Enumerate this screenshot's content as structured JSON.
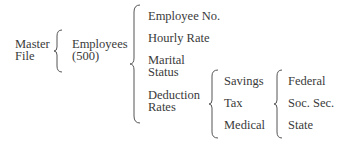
{
  "diagram": {
    "type": "bracket-hierarchy",
    "root": {
      "line1": "Master",
      "line2": "File"
    },
    "level1": {
      "line1": "Employees",
      "line2": "(500)"
    },
    "level2": [
      {
        "id": "employee-no",
        "lines": [
          "Employee No."
        ]
      },
      {
        "id": "hourly-rate",
        "lines": [
          "Hourly Rate"
        ]
      },
      {
        "id": "marital-status",
        "lines": [
          "Marital",
          "Status"
        ]
      },
      {
        "id": "deduction-rates",
        "lines": [
          "Deduction",
          "Rates"
        ]
      }
    ],
    "level3": [
      {
        "id": "savings",
        "label": "Savings"
      },
      {
        "id": "tax",
        "label": "Tax"
      },
      {
        "id": "medical",
        "label": "Medical"
      }
    ],
    "level4": [
      {
        "id": "federal",
        "label": "Federal"
      },
      {
        "id": "soc-sec",
        "label": "Soc. Sec."
      },
      {
        "id": "state",
        "label": "State"
      }
    ]
  },
  "colors": {
    "text": "#3a3a3a",
    "brace": "#555555",
    "background": "#ffffff"
  }
}
